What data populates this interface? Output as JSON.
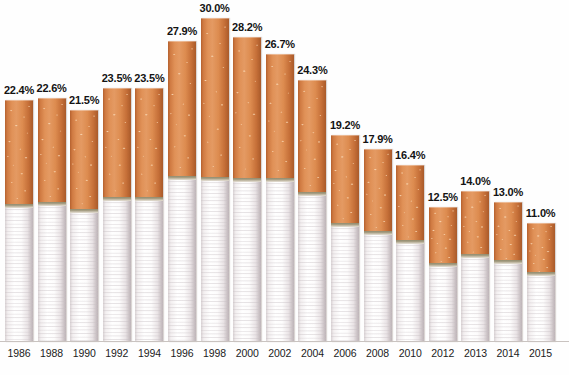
{
  "chart_data": {
    "type": "bar",
    "title": "",
    "subtitle": "",
    "xlabel": "",
    "ylabel": "",
    "categories": [
      "1986",
      "1988",
      "1990",
      "1992",
      "1994",
      "1996",
      "1998",
      "2000",
      "2002",
      "2004",
      "2006",
      "2008",
      "2010",
      "2012",
      "2013",
      "2014",
      "2015"
    ],
    "values": [
      22.4,
      22.6,
      21.5,
      23.5,
      23.5,
      27.9,
      30.0,
      28.2,
      26.7,
      24.3,
      19.2,
      17.9,
      16.4,
      12.5,
      14.0,
      13.0,
      11.0
    ],
    "data_labels": [
      "22.4%",
      "22.6%",
      "21.5%",
      "23.5%",
      "23.5%",
      "27.9%",
      "30.0%",
      "28.2%",
      "26.7%",
      "24.3%",
      "19.2%",
      "17.9%",
      "16.4%",
      "12.5%",
      "14.0%",
      "13.0%",
      "11.0%"
    ],
    "value_suffix": "%",
    "ylim": [
      0,
      31.5
    ],
    "grid": false,
    "legend": null,
    "annotations": [],
    "series": [
      {
        "name": "",
        "values": [
          22.4,
          22.6,
          21.5,
          23.5,
          23.5,
          27.9,
          30.0,
          28.2,
          26.7,
          24.3,
          19.2,
          17.9,
          16.4,
          12.5,
          14.0,
          13.0,
          11.0
        ]
      }
    ],
    "bar_style": "cigarette-pictograph",
    "filter_fraction": [
      0.44,
      0.44,
      0.44,
      0.44,
      0.44,
      0.46,
      0.5,
      0.47,
      0.44,
      0.44,
      0.44,
      0.44,
      0.44,
      0.44,
      0.44,
      0.44,
      0.44
    ]
  },
  "colors": {
    "filter_orange": "#dd8c50",
    "filter_orange_dark": "#a95a2a",
    "filter_speckle": "#fcdebc",
    "paper_white": "#ffffff",
    "paper_shadow": "#c9c0c3",
    "band_olive": "#8d8a6e",
    "label_text": "#131313",
    "axis_line": "#c9c3c0",
    "background": "#fefefe"
  }
}
